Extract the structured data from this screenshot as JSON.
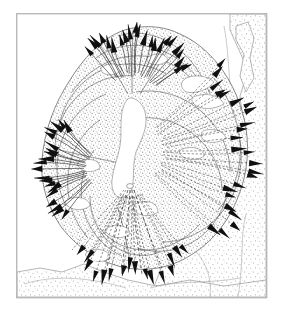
{
  "figure": {
    "kind": "map-diagram",
    "title_visible": false,
    "caption_visible": false,
    "background_color": "#ffffff",
    "frame": {
      "name": "plate-border",
      "color": "#b9b9b9",
      "x": 16,
      "y": 13,
      "width": 251,
      "height": 285
    },
    "ink_color": "#242424",
    "arrow_color": "#101010",
    "stipple_color": "#9a9a9a",
    "stipple_color_light": "#bdbdbd"
  },
  "chart_data": {
    "type": "scatter",
    "title": "",
    "xlabel": "",
    "ylabel": "",
    "grid": false,
    "legend": "none",
    "xlim": [
      16,
      267
    ],
    "ylim": [
      13,
      298
    ],
    "flow_centers": [
      {
        "name": "primary-source",
        "x": 131,
        "y": 182,
        "label": ""
      },
      {
        "name": "northern-source",
        "x": 133,
        "y": 96,
        "label": ""
      },
      {
        "name": "western-lobe-source",
        "x": 99,
        "y": 171,
        "label": ""
      }
    ],
    "series": [
      {
        "name": "radial-flow-arrows-north",
        "center_x": 133,
        "center_y": 100,
        "angle_start": -132,
        "angle_end": -30,
        "count": 22,
        "r_inner": 26,
        "r_outer": 72,
        "style": "solid-with-arrowhead"
      },
      {
        "name": "radial-flow-arrows-east",
        "center_x": 131,
        "center_y": 152,
        "angle_start": -46,
        "angle_end": 44,
        "count": 24,
        "r_inner": 34,
        "r_outer": 124,
        "style": "dashed-with-arrowhead"
      },
      {
        "name": "radial-flow-arrows-south",
        "center_x": 131,
        "center_y": 181,
        "angle_start": 52,
        "angle_end": 126,
        "count": 16,
        "r_inner": 16,
        "r_outer": 100,
        "style": "dashed-with-arrowhead"
      },
      {
        "name": "radial-flow-arrows-west",
        "center_x": 103,
        "center_y": 168,
        "angle_start": 130,
        "angle_end": 232,
        "count": 20,
        "r_inner": 18,
        "r_outer": 66,
        "style": "solid-with-arrowhead"
      }
    ],
    "annotations": []
  },
  "regions": [
    {
      "name": "main-lobe-stipple",
      "texture": "fine-stipple",
      "tone": "medium"
    },
    {
      "name": "outer-terrain-stipple",
      "texture": "coarse-stipple",
      "tone": "light"
    },
    {
      "name": "central-vent-patch",
      "texture": "blank-white",
      "tone": "none"
    },
    {
      "name": "interior-blank-patches",
      "texture": "blank-white",
      "tone": "none"
    }
  ]
}
